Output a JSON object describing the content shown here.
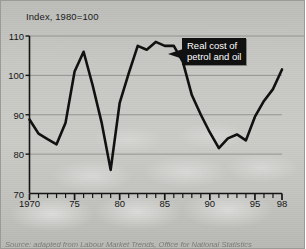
{
  "figure": {
    "source_note": "Source: adapted from Labour Market Trends, Office for National Statistics",
    "callout": {
      "line1": "Real cost of",
      "line2": "petrol and oil"
    },
    "colors": {
      "line": "#111111",
      "background": "#c9cac6",
      "gridline": "#8d8e8a",
      "axis": "#151515",
      "callout_bg": "#111111",
      "callout_text": "#ffffff"
    }
  },
  "chart_data": {
    "type": "line",
    "title": "Index, 1980=100",
    "xlabel": "",
    "ylabel": "Index, 1980=100",
    "ylim": [
      70,
      110
    ],
    "xlim": [
      1970,
      1998
    ],
    "yticks": [
      70,
      80,
      90,
      100,
      110
    ],
    "ytick_labels": [
      "70",
      "80",
      "90",
      "100",
      "110"
    ],
    "xticks": [
      1970,
      1971,
      1972,
      1973,
      1974,
      1975,
      1976,
      1977,
      1978,
      1979,
      1980,
      1981,
      1982,
      1983,
      1984,
      1985,
      1986,
      1987,
      1988,
      1989,
      1990,
      1991,
      1992,
      1993,
      1994,
      1995,
      1996,
      1997,
      1998
    ],
    "xtick_labels_shown": [
      "1970",
      "75",
      "80",
      "85",
      "90",
      "95",
      "98"
    ],
    "xtick_label_values": [
      1970,
      1975,
      1980,
      1985,
      1990,
      1995,
      1998
    ],
    "grid": "horizontal",
    "legend": "none",
    "annotations": [
      {
        "text": "Real cost of petrol and oil",
        "points_to_year": 1985,
        "points_to_value": 108
      }
    ],
    "series": [
      {
        "name": "Real cost of petrol and oil",
        "x": [
          1970,
          1971,
          1972,
          1973,
          1974,
          1975,
          1976,
          1977,
          1978,
          1979,
          1980,
          1981,
          1982,
          1983,
          1984,
          1985,
          1986,
          1987,
          1988,
          1989,
          1990,
          1991,
          1992,
          1993,
          1994,
          1995,
          1996,
          1997,
          1998
        ],
        "values": [
          88.8,
          85.2,
          83.8,
          82.5,
          88.0,
          101.0,
          106.0,
          97.5,
          88.0,
          76.0,
          93.0,
          100.5,
          107.5,
          106.5,
          108.5,
          107.5,
          107.5,
          103.5,
          95.0,
          90.0,
          85.5,
          81.5,
          84.0,
          85.0,
          83.5,
          89.5,
          93.5,
          96.5,
          101.5
        ]
      }
    ]
  }
}
